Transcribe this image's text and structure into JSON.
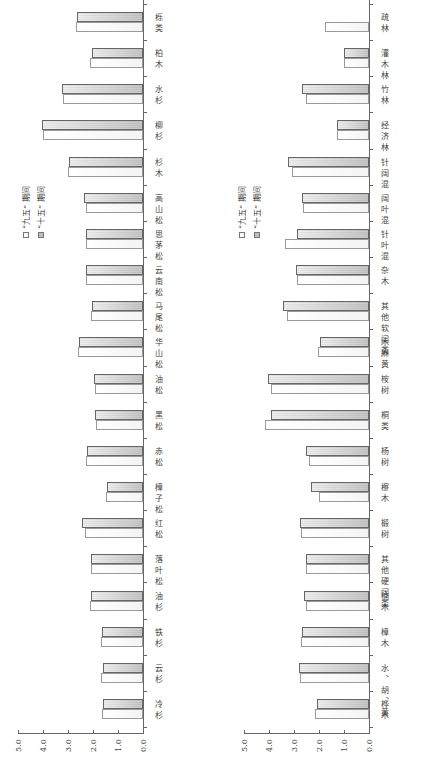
{
  "chart_data": [
    {
      "type": "bar",
      "orientation_note": "figure rotated 90 degrees counter-clockwise",
      "title": "",
      "xlabel": "",
      "ylabel": "固碳量/(t · hm⁻² · a⁻¹)",
      "ylim": [
        0,
        5
      ],
      "yticks": [
        "0.0",
        "1.0",
        "2.0",
        "3.0",
        "4.0",
        "5.0"
      ],
      "grid": false,
      "legend_position": "upper-left (in rotated image, left middle)",
      "categories": [
        "冷杉",
        "云杉",
        "铁杉",
        "油杉",
        "落叶松",
        "红松",
        "樟子松",
        "赤松",
        "黑松",
        "油松",
        "华山松",
        "马尾松",
        "云南松",
        "思茅松",
        "高山松",
        "杉木",
        "柳杉",
        "水杉",
        "柏木",
        "栎类"
      ],
      "series": [
        {
          "name": "“九五”期间",
          "values": [
            1.64,
            1.68,
            1.68,
            2.12,
            2.08,
            2.32,
            1.48,
            2.28,
            1.88,
            1.92,
            2.6,
            2.08,
            2.28,
            2.28,
            2.28,
            3.0,
            4.0,
            3.2,
            2.12,
            2.68
          ]
        },
        {
          "name": "“十五”期间",
          "values": [
            1.6,
            1.6,
            1.64,
            2.08,
            2.08,
            2.44,
            1.44,
            2.24,
            1.92,
            1.96,
            2.56,
            2.04,
            2.28,
            2.28,
            2.36,
            2.96,
            4.04,
            3.24,
            2.04,
            2.64
          ]
        }
      ]
    },
    {
      "type": "bar",
      "orientation_note": "figure rotated 90 degrees counter-clockwise",
      "title": "",
      "xlabel": "",
      "ylabel": "固碳量/(t · hm⁻² · a⁻¹)",
      "ylim": [
        0,
        5
      ],
      "yticks": [
        "0.0",
        "1.0",
        "2.0",
        "3.0",
        "4.0",
        "5.0"
      ],
      "grid": false,
      "legend_position": "upper-left (in rotated image, left middle)",
      "categories": [
        "桦木",
        "水、胡、黄",
        "樟木",
        "楠木",
        "其他硬阔类",
        "椴树",
        "檫木",
        "杨树",
        "桐类",
        "桉树",
        "木麻黄",
        "其他软阔类",
        "杂木",
        "针叶混",
        "阔叶混",
        "针阔混",
        "经济林",
        "竹林",
        "灌木林",
        "疏林"
      ],
      "series": [
        {
          "name": "“九五”期间",
          "values": [
            2.16,
            2.76,
            2.72,
            2.52,
            2.52,
            2.72,
            2.0,
            2.4,
            4.16,
            3.92,
            2.04,
            3.28,
            2.88,
            3.36,
            2.64,
            3.08,
            1.28,
            2.52,
            1.0,
            1.76
          ]
        },
        {
          "name": "“十五”期间",
          "values": [
            2.08,
            2.8,
            2.68,
            2.6,
            2.52,
            2.76,
            2.32,
            2.52,
            3.92,
            4.04,
            1.96,
            3.44,
            2.92,
            2.88,
            2.68,
            3.24,
            1.28,
            2.68,
            1.0,
            null
          ]
        }
      ]
    }
  ],
  "legend": {
    "item_95": "“九五” 期间",
    "item_10": "“十五” 期间"
  },
  "axis": {
    "title": "固碳量/(t · hm⁻² · a⁻¹)",
    "ticks": [
      "0.0",
      "1.0",
      "2.0",
      "3.0",
      "4.0",
      "5.0"
    ]
  }
}
